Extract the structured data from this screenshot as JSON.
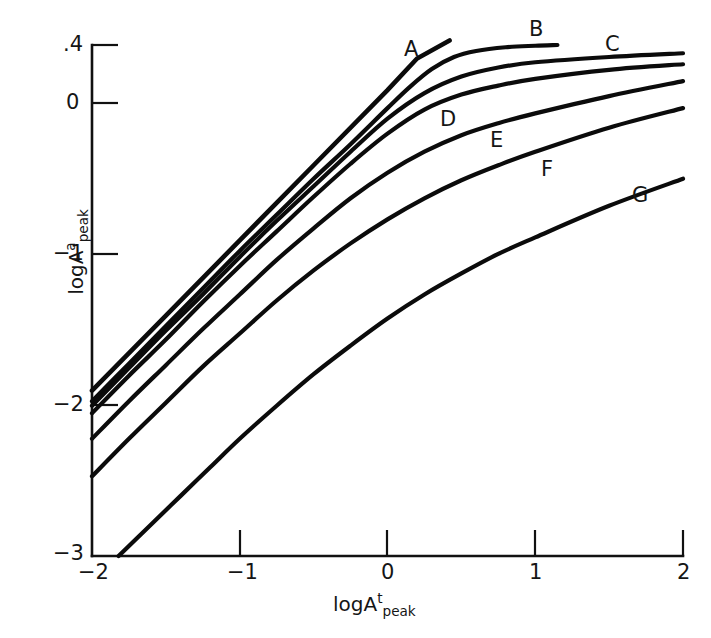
{
  "figure": {
    "background_color": "#ffffff",
    "line_color": "#0b0b0b",
    "axis_color": "#111111"
  },
  "axes": {
    "x_title_main": "logA",
    "x_title_sup": "t",
    "x_title_sub": "peak",
    "y_title_main": "logA",
    "y_title_sup": "a",
    "y_title_sub": "peak",
    "x_tick_labels": [
      "−2",
      "−1",
      "0",
      "1",
      "2"
    ],
    "y_tick_labels": [
      ".4",
      "0",
      "−1",
      "−2",
      "−3"
    ]
  },
  "curve_labels": {
    "a": "A",
    "b": "B",
    "c": "C",
    "d": "D",
    "e": "E",
    "f": "F",
    "g": "G"
  },
  "chart_data": {
    "type": "line",
    "title": "",
    "xlabel": "logA t_peak",
    "ylabel": "logA a_peak",
    "xlim": [
      -2,
      2
    ],
    "ylim": [
      -3,
      0.4
    ],
    "xticks": [
      -2,
      -1,
      0,
      1,
      2
    ],
    "yticks": [
      0.4,
      0,
      -1,
      -2,
      -3
    ],
    "grid": false,
    "legend": "inline-curve-labels",
    "series": [
      {
        "name": "A",
        "note": "straight asymptote line of unit slope; terminates at its tangency region",
        "points": [
          [
            -2.0,
            -1.9
          ],
          [
            -1.5,
            -1.4
          ],
          [
            -1.0,
            -0.9
          ],
          [
            -0.5,
            -0.4
          ],
          [
            0.0,
            0.1
          ],
          [
            0.2,
            0.31
          ],
          [
            0.42,
            0.43
          ]
        ]
      },
      {
        "name": "B",
        "points": [
          [
            -2.0,
            -1.97
          ],
          [
            -1.75,
            -1.72
          ],
          [
            -1.5,
            -1.47
          ],
          [
            -1.25,
            -1.22
          ],
          [
            -1.0,
            -0.97
          ],
          [
            -0.75,
            -0.73
          ],
          [
            -0.5,
            -0.49
          ],
          [
            -0.25,
            -0.26
          ],
          [
            0.0,
            -0.02
          ],
          [
            0.15,
            0.12
          ],
          [
            0.3,
            0.24
          ],
          [
            0.45,
            0.32
          ],
          [
            0.6,
            0.36
          ],
          [
            0.8,
            0.385
          ],
          [
            1.0,
            0.395
          ],
          [
            1.15,
            0.4
          ]
        ]
      },
      {
        "name": "C",
        "points": [
          [
            -2.0,
            -2.0
          ],
          [
            -1.75,
            -1.75
          ],
          [
            -1.5,
            -1.5
          ],
          [
            -1.25,
            -1.26
          ],
          [
            -1.0,
            -1.01
          ],
          [
            -0.75,
            -0.77
          ],
          [
            -0.5,
            -0.54
          ],
          [
            -0.25,
            -0.31
          ],
          [
            0.0,
            -0.09
          ],
          [
            0.25,
            0.08
          ],
          [
            0.5,
            0.19
          ],
          [
            0.75,
            0.25
          ],
          [
            1.0,
            0.285
          ],
          [
            1.5,
            0.32
          ],
          [
            2.0,
            0.345
          ]
        ]
      },
      {
        "name": "D",
        "points": [
          [
            -2.0,
            -2.05
          ],
          [
            -1.75,
            -1.8
          ],
          [
            -1.5,
            -1.56
          ],
          [
            -1.25,
            -1.31
          ],
          [
            -1.0,
            -1.07
          ],
          [
            -0.75,
            -0.84
          ],
          [
            -0.5,
            -0.61
          ],
          [
            -0.25,
            -0.39
          ],
          [
            0.0,
            -0.19
          ],
          [
            0.25,
            -0.03
          ],
          [
            0.5,
            0.07
          ],
          [
            0.75,
            0.13
          ],
          [
            1.0,
            0.175
          ],
          [
            1.5,
            0.235
          ],
          [
            2.0,
            0.272
          ]
        ]
      },
      {
        "name": "E",
        "points": [
          [
            -2.0,
            -2.22
          ],
          [
            -1.75,
            -1.97
          ],
          [
            -1.5,
            -1.73
          ],
          [
            -1.25,
            -1.49
          ],
          [
            -1.0,
            -1.26
          ],
          [
            -0.75,
            -1.03
          ],
          [
            -0.5,
            -0.82
          ],
          [
            -0.25,
            -0.62
          ],
          [
            0.0,
            -0.45
          ],
          [
            0.25,
            -0.31
          ],
          [
            0.5,
            -0.2
          ],
          [
            0.75,
            -0.12
          ],
          [
            1.0,
            -0.055
          ],
          [
            1.5,
            0.06
          ],
          [
            2.0,
            0.16
          ]
        ]
      },
      {
        "name": "F",
        "points": [
          [
            -2.0,
            -2.47
          ],
          [
            -1.75,
            -2.22
          ],
          [
            -1.5,
            -1.98
          ],
          [
            -1.25,
            -1.74
          ],
          [
            -1.0,
            -1.52
          ],
          [
            -0.75,
            -1.3
          ],
          [
            -0.5,
            -1.1
          ],
          [
            -0.25,
            -0.92
          ],
          [
            0.0,
            -0.76
          ],
          [
            0.25,
            -0.62
          ],
          [
            0.5,
            -0.5
          ],
          [
            0.75,
            -0.4
          ],
          [
            1.0,
            -0.31
          ],
          [
            1.5,
            -0.15
          ],
          [
            2.0,
            -0.02
          ]
        ]
      },
      {
        "name": "G",
        "points": [
          [
            -1.82,
            -3.0
          ],
          [
            -1.6,
            -2.79
          ],
          [
            -1.4,
            -2.6
          ],
          [
            -1.2,
            -2.41
          ],
          [
            -1.0,
            -2.22
          ],
          [
            -0.75,
            -2.0
          ],
          [
            -0.5,
            -1.79
          ],
          [
            -0.25,
            -1.6
          ],
          [
            0.0,
            -1.42
          ],
          [
            0.25,
            -1.26
          ],
          [
            0.5,
            -1.12
          ],
          [
            0.75,
            -0.99
          ],
          [
            1.0,
            -0.88
          ],
          [
            1.5,
            -0.67
          ],
          [
            2.0,
            -0.49
          ]
        ]
      }
    ]
  }
}
